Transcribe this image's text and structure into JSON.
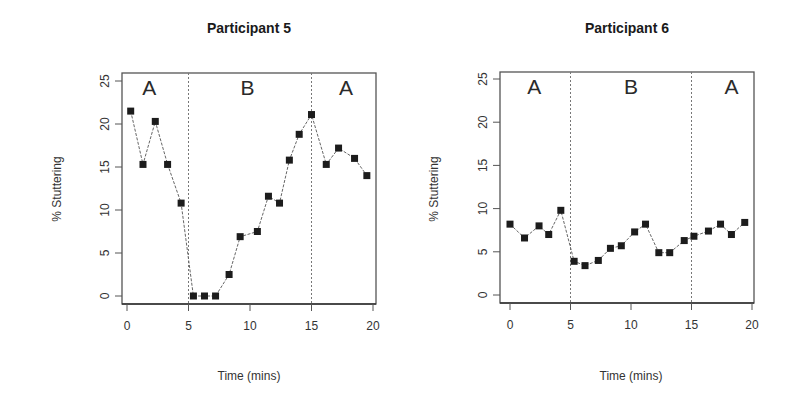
{
  "chart_data": [
    {
      "type": "scatter",
      "title": "Participant 5",
      "xlabel": "Time (mins)",
      "ylabel": "% Stuttering",
      "xlim": [
        0,
        20
      ],
      "ylim": [
        0,
        25
      ],
      "xticks": [
        0,
        5,
        10,
        15,
        20
      ],
      "yticks": [
        0,
        5,
        10,
        15,
        20,
        25
      ],
      "grid": false,
      "legend": null,
      "phase_boundaries": [
        5,
        15
      ],
      "phase_labels": [
        {
          "label": "A",
          "x": 1.8
        },
        {
          "label": "B",
          "x": 9.8
        },
        {
          "label": "A",
          "x": 17.8
        }
      ],
      "series": [
        {
          "name": "% Stuttering",
          "marker": "square",
          "line": "dashed",
          "x": [
            0.3,
            1.3,
            2.3,
            3.3,
            4.4,
            5.4,
            6.3,
            7.2,
            8.3,
            9.2,
            10.6,
            11.5,
            12.4,
            13.2,
            14.0,
            15.0,
            16.2,
            17.2,
            18.5,
            19.5
          ],
          "y": [
            21.5,
            15.3,
            20.3,
            15.3,
            10.8,
            0.0,
            0.0,
            0.0,
            2.5,
            6.9,
            7.5,
            11.6,
            10.8,
            15.8,
            18.8,
            21.1,
            15.3,
            17.2,
            16.0,
            14.0
          ]
        }
      ]
    },
    {
      "type": "scatter",
      "title": "Participant 6",
      "xlabel": "Time (mins)",
      "ylabel": "% Stuttering",
      "xlim": [
        0,
        20
      ],
      "ylim": [
        0,
        25
      ],
      "xticks": [
        0,
        5,
        10,
        15,
        20
      ],
      "yticks": [
        0,
        5,
        10,
        15,
        20,
        25
      ],
      "grid": false,
      "legend": null,
      "phase_boundaries": [
        5,
        15
      ],
      "phase_labels": [
        {
          "label": "A",
          "x": 2.0
        },
        {
          "label": "B",
          "x": 10.0
        },
        {
          "label": "A",
          "x": 18.3
        }
      ],
      "series": [
        {
          "name": "% Stuttering",
          "marker": "square",
          "line": "dashed",
          "x": [
            0.0,
            1.2,
            2.4,
            3.2,
            4.2,
            5.3,
            6.2,
            7.3,
            8.3,
            9.2,
            10.3,
            11.2,
            12.3,
            13.2,
            14.4,
            15.2,
            16.4,
            17.4,
            18.3,
            19.4
          ],
          "y": [
            8.2,
            6.6,
            8.0,
            7.0,
            9.8,
            3.9,
            3.4,
            4.0,
            5.4,
            5.7,
            7.3,
            8.2,
            4.9,
            4.9,
            6.3,
            6.8,
            7.4,
            8.2,
            7.0,
            8.4
          ]
        }
      ]
    }
  ],
  "panels": [
    {
      "title": "Participant 5",
      "xlabel": "Time (mins)",
      "ylabel": "% Stuttering"
    },
    {
      "title": "Participant 6",
      "xlabel": "Time (mins)",
      "ylabel": "% Stuttering"
    }
  ],
  "colors": {
    "marker": "#1c1c1c",
    "frame": "#555555",
    "text": "#333333",
    "background": "#ffffff"
  }
}
